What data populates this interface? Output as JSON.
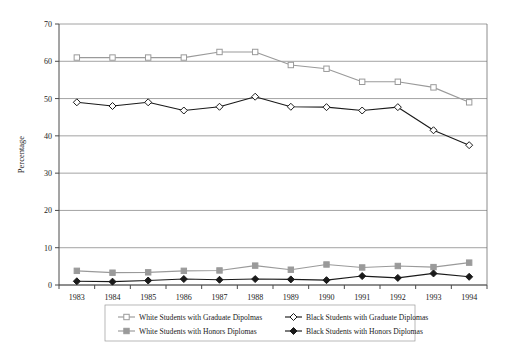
{
  "chart_data": {
    "type": "line",
    "title": "",
    "xlabel": "Year",
    "ylabel": "Percentage",
    "categories": [
      "1983",
      "1984",
      "1985",
      "1986",
      "1987",
      "1988",
      "1989",
      "1990",
      "1991",
      "1992",
      "1993",
      "1994"
    ],
    "x": [
      1983,
      1984,
      1985,
      1986,
      1987,
      1988,
      1989,
      1990,
      1991,
      1992,
      1993,
      1994
    ],
    "ylim": [
      0,
      70
    ],
    "yticks": [
      0,
      10,
      20,
      30,
      40,
      50,
      60,
      70
    ],
    "ytick_labels": [
      "0",
      "10",
      "20",
      "30",
      "40",
      "50",
      "60",
      "70"
    ],
    "xtick_labels": [
      "1983",
      "1984",
      "1985",
      "1986",
      "1987",
      "1988",
      "1989",
      "1990",
      "1991",
      "1992",
      "1993",
      "1994"
    ],
    "grid": "horizontal-gridlines-only",
    "legend_position": "bottom",
    "series": [
      {
        "name": "White Students with Graduate Dipolmas",
        "marker": "open-square",
        "color": "#9a9a9a",
        "values": [
          61,
          61,
          61,
          61,
          62.5,
          62.5,
          59,
          58,
          54.5,
          54.5,
          53,
          49
        ]
      },
      {
        "name": "Black Students with Graduate Diplomas",
        "marker": "open-diamond",
        "color": "#1a1a1a",
        "values": [
          49,
          48,
          49,
          46.8,
          47.8,
          50.5,
          47.8,
          47.7,
          46.8,
          47.7,
          41.5,
          37.5
        ]
      },
      {
        "name": "White Students with Honors Diplomas",
        "marker": "filled-square",
        "color": "#9a9a9a",
        "values": [
          3.8,
          3.3,
          3.4,
          3.8,
          3.9,
          5.2,
          4.1,
          5.5,
          4.7,
          5.1,
          4.8,
          6.0
        ]
      },
      {
        "name": "Black Students with Honors Diplomas",
        "marker": "filled-diamond",
        "color": "#1a1a1a",
        "values": [
          1.0,
          0.9,
          1.2,
          1.6,
          1.4,
          1.6,
          1.5,
          1.3,
          2.4,
          1.9,
          3.1,
          2.2
        ]
      }
    ]
  },
  "legend": {
    "entries": [
      {
        "label": "White Students with Graduate Dipolmas",
        "marker": "open-square",
        "color": "#9a9a9a"
      },
      {
        "label": "Black Students with Graduate Diplomas",
        "marker": "open-diamond",
        "color": "#1a1a1a"
      },
      {
        "label": "White Students with Honors Diplomas",
        "marker": "filled-square",
        "color": "#9a9a9a"
      },
      {
        "label": "Black Students with Honors Diplomas",
        "marker": "filled-diamond",
        "color": "#1a1a1a"
      }
    ]
  },
  "axes": {
    "y_title": "Percentage",
    "x_title": "Year"
  },
  "colors": {
    "gray_series": "#9a9a9a",
    "black_series": "#1a1a1a",
    "gridline": "#8c8c8c",
    "axis": "#4a4a4a",
    "background": "#ffffff"
  }
}
